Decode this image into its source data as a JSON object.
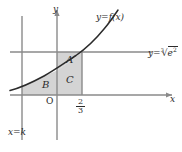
{
  "figure": {
    "colors": {
      "axis": "#8a8a8a",
      "curve": "#2b2b2b",
      "shade": "#d4d4d4",
      "text": "#2b2b2b"
    },
    "axis_labels": {
      "x": "x",
      "y": "y",
      "origin": "O"
    },
    "tick": {
      "numerator": "2",
      "denominator": "3"
    },
    "curve_label": "y=f(x)",
    "hline_label": {
      "lhs": "y=",
      "root_index": "3",
      "radical": "√",
      "radicand": "e",
      "exponent": "2"
    },
    "vline_label": "x=k",
    "regions": [
      {
        "name": "A",
        "label": "A"
      },
      {
        "name": "B",
        "label": "B"
      },
      {
        "name": "C",
        "label": "C"
      }
    ]
  }
}
